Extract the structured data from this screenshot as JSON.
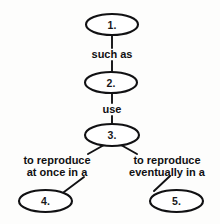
{
  "diagram": {
    "type": "concept-map",
    "background_color": "#fdfdfc",
    "stroke_color": "#111113",
    "text_color": "#101012",
    "nodes": [
      {
        "id": "node-1",
        "label": "1.",
        "cx": 112,
        "cy": 24.5,
        "rx": 26,
        "ry": 10.5
      },
      {
        "id": "node-2",
        "label": "2.",
        "cx": 111,
        "cy": 82.5,
        "rx": 26,
        "ry": 10.5
      },
      {
        "id": "node-3",
        "label": "3.",
        "cx": 112,
        "cy": 135,
        "rx": 27,
        "ry": 11
      },
      {
        "id": "node-4",
        "label": "4.",
        "cx": 45.5,
        "cy": 201,
        "rx": 26.5,
        "ry": 11
      },
      {
        "id": "node-5",
        "label": "5.",
        "cx": 176.5,
        "cy": 201,
        "rx": 26.5,
        "ry": 11
      }
    ],
    "link_labels": [
      {
        "id": "link-label-1",
        "lines": [
          "such as"
        ],
        "x": 112,
        "y": 58,
        "align": "middle"
      },
      {
        "id": "link-label-2",
        "lines": [
          "use"
        ],
        "x": 112,
        "y": 113,
        "align": "middle"
      },
      {
        "id": "link-label-3",
        "lines": [
          "to reproduce",
          "at once in a"
        ],
        "x": 57,
        "y": 164,
        "align": "middle"
      },
      {
        "id": "link-label-4",
        "lines": [
          "to reproduce",
          "eventually in a"
        ],
        "x": 167,
        "y": 164,
        "align": "middle"
      }
    ],
    "edges": [
      {
        "id": "edge-1-to-label1",
        "d": "M 112 35 L 112 48"
      },
      {
        "id": "edge-label1-to-2",
        "d": "M 112 61 L 112 72"
      },
      {
        "id": "edge-2-to-label2",
        "d": "M 112 93 L 112 103"
      },
      {
        "id": "edge-label2-to-3",
        "d": "M 112 116 L 112 124"
      },
      {
        "id": "edge-3-to-label3",
        "d": "M 104 145 L 88 154"
      },
      {
        "id": "edge-3-to-label4",
        "d": "M 121 145 L 137 154"
      },
      {
        "id": "edge-label3-to-4",
        "d": "M 84 177 L 64 192"
      },
      {
        "id": "edge-label4-to-5",
        "d": "M 170 176 L 154 191"
      }
    ]
  }
}
